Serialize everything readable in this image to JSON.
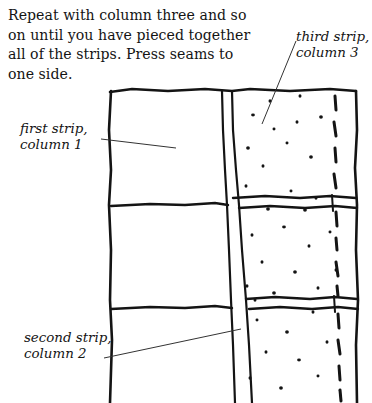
{
  "page": {
    "width": 372,
    "height": 403,
    "background": "#ffffff",
    "ink_color": "#141414"
  },
  "instruction": {
    "text": "Repeat with column three and so on until you have pieced together all of the strips. Press seams to one side.",
    "lines": [
      "Repeat with column three and",
      "so on until you have pieced",
      "together all of the strips. Press",
      "seams to one side."
    ]
  },
  "callouts": [
    {
      "id": "third-strip",
      "label": "third strip,\ncolumn 3",
      "lines": [
        "third strip,",
        "column 3"
      ],
      "leader": {
        "x1": 296,
        "y1": 41,
        "x2": 262,
        "y2": 124
      }
    },
    {
      "id": "first-strip",
      "label": "first strip,\ncolumn 1",
      "lines": [
        "first strip,",
        "column 1"
      ],
      "leader": {
        "x1": 101,
        "y1": 139,
        "x2": 176,
        "y2": 148
      }
    },
    {
      "id": "second-strip",
      "label": "second strip,\ncolumn 2",
      "lines": [
        "second strip,",
        "column 2"
      ],
      "leader": {
        "x1": 104,
        "y1": 358,
        "x2": 241,
        "y2": 329
      }
    }
  ],
  "diagram": {
    "outline": {
      "top_y": 90,
      "left_x": 110,
      "right_x": 357,
      "bottom_y": 403
    },
    "column_seams": [
      {
        "name": "column1-column2-seam-left",
        "top_x": 222,
        "bottom_x": 232
      },
      {
        "name": "column1-column2-seam-right",
        "top_x": 232,
        "bottom_x": 245
      }
    ],
    "horizontal_seams": [
      {
        "name": "upper-strip-seam",
        "y": 204
      },
      {
        "name": "lower-strip-seam",
        "y": 304
      }
    ],
    "dashed_stitch_line": {
      "name": "stitching-guide",
      "x": 336
    },
    "print_fabric": {
      "name": "dotted-print-column-3",
      "dot_color": "#141414",
      "dots": [
        [
          253,
          115
        ],
        [
          270,
          101
        ],
        [
          297,
          122
        ],
        [
          321,
          117
        ],
        [
          287,
          143
        ],
        [
          263,
          166
        ],
        [
          311,
          157
        ],
        [
          246,
          186
        ],
        [
          291,
          191
        ],
        [
          268,
          209
        ],
        [
          316,
          198
        ],
        [
          252,
          235
        ],
        [
          284,
          227
        ],
        [
          309,
          246
        ],
        [
          262,
          262
        ],
        [
          295,
          272
        ],
        [
          330,
          232
        ],
        [
          247,
          286
        ],
        [
          274,
          293
        ],
        [
          318,
          288
        ],
        [
          257,
          320
        ],
        [
          287,
          332
        ],
        [
          313,
          312
        ],
        [
          266,
          352
        ],
        [
          299,
          360
        ],
        [
          327,
          342
        ],
        [
          250,
          378
        ],
        [
          281,
          388
        ],
        [
          318,
          376
        ],
        [
          300,
          96
        ],
        [
          248,
          148
        ],
        [
          336,
          270
        ],
        [
          274,
          129
        ],
        [
          305,
          210
        ],
        [
          255,
          300
        ]
      ]
    }
  }
}
